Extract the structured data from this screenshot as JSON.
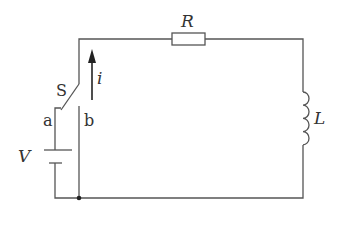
{
  "diagram": {
    "type": "RL circuit with switch",
    "labels": {
      "resistor": "R",
      "inductor": "L",
      "switch": "S",
      "current": "i",
      "voltage": "V",
      "terminal_a": "a",
      "terminal_b": "b"
    },
    "colors": {
      "wire": "#555555",
      "text": "#333333",
      "background": "#ffffff"
    }
  }
}
